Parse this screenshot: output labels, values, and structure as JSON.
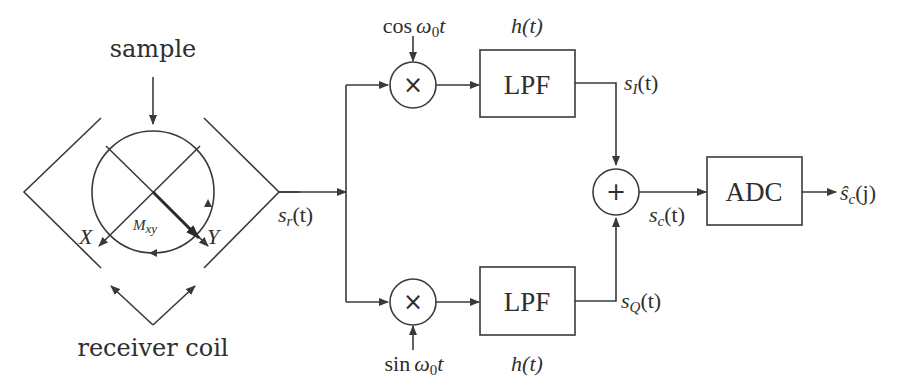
{
  "diagram": {
    "left_section": {
      "sample_label": "sample",
      "receiver_coil_label": "receiver coil",
      "axis_x_label": "X",
      "axis_y_label": "Y",
      "magnetization_label": {
        "main": "M",
        "sub": "xy"
      }
    },
    "signals": {
      "received": {
        "main": "s",
        "sub": "r",
        "arg": "(t)"
      },
      "in_phase": {
        "main": "s",
        "sub": "I",
        "arg": "(t)"
      },
      "quadrature": {
        "main": "s",
        "sub": "Q",
        "arg": "(t)"
      },
      "complex": {
        "main": "s",
        "sub": "c",
        "arg": "(t)"
      },
      "sampled": {
        "main": "ŝ",
        "sub": "c",
        "arg": "(j)"
      }
    },
    "mixers": {
      "top": {
        "symbol": "×",
        "reference": {
          "fn": "cos",
          "omega": "ω",
          "sub": "0",
          "var": "t"
        }
      },
      "bottom": {
        "symbol": "×",
        "reference": {
          "fn": "sin",
          "omega": "ω",
          "sub": "0",
          "var": "t"
        }
      }
    },
    "filters": {
      "top": {
        "label": "LPF",
        "response": "h(t)"
      },
      "bottom": {
        "label": "LPF",
        "response": "h(t)"
      }
    },
    "summer": {
      "symbol": "+"
    },
    "converter": {
      "label": "ADC"
    },
    "colors": {
      "stroke": "#3a3a3a",
      "text": "#2e2e2e",
      "background": "#ffffff"
    }
  }
}
